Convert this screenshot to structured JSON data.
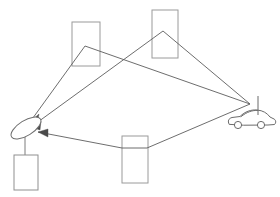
{
  "canvas": {
    "width": 280,
    "height": 197,
    "background": "#ffffff",
    "title": "Multipath radio propagation diagram"
  },
  "palette": {
    "building_stroke": "#9a9a9a",
    "equipment_stroke": "#8f8f8f",
    "ray_stroke": "#5c5c5c",
    "arrow_fill": "#4a4a4a",
    "dish_stroke": "#6e6e6e",
    "vehicle_stroke": "#6b6b6b",
    "background": "#ffffff"
  },
  "scene": {
    "label": "multipath-propagation-scene",
    "description": "A parabolic dish ground station receives one direct path and two reflected paths from a moving vehicle with a whip antenna.",
    "node_count": 6,
    "ray_count": 3
  },
  "buildings": [
    {
      "name": "building-top-left",
      "x": 72,
      "y": 22,
      "width": 28,
      "height": 44,
      "role": "reflector"
    },
    {
      "name": "building-top-right",
      "x": 152,
      "y": 10,
      "width": 26,
      "height": 48,
      "role": "reflector"
    },
    {
      "name": "building-bottom-center",
      "x": 122,
      "y": 136,
      "width": 26,
      "height": 47,
      "role": "reflector"
    }
  ],
  "ground_station": {
    "name": "satellite-dish-ground-station",
    "dish": {
      "cx": 26,
      "cy": 128,
      "rx": 17,
      "ry": 7.5,
      "rotation_deg": -28
    },
    "mast": {
      "x1": 25,
      "y1": 135,
      "x2": 25,
      "y2": 155
    },
    "equipment_box": {
      "x": 14,
      "y": 155,
      "width": 24,
      "height": 35
    }
  },
  "vehicle": {
    "name": "car-with-whip-antenna",
    "body_x": 228,
    "body_y": 112,
    "body_width": 44,
    "body_height": 16,
    "antenna": {
      "x1": 258,
      "y1": 96,
      "x2": 258,
      "y2": 114
    },
    "wheels": [
      {
        "cx": 238,
        "cy": 126,
        "r": 3.6
      },
      {
        "cx": 260,
        "cy": 126,
        "r": 3.6
      }
    ]
  },
  "rays": [
    {
      "name": "ray-reflected-via-top-left-building",
      "points": "250,104 85,46 30,122",
      "arrow_at": "30,122",
      "arrow_angle_deg": 126,
      "path_type": "reflected"
    },
    {
      "name": "ray-reflected-via-top-right-building",
      "points": "250,104 163,31 31,127",
      "arrow_at": "31,127",
      "arrow_angle_deg": 140,
      "path_type": "reflected"
    },
    {
      "name": "ray-reflected-via-bottom-building",
      "points": "250,104 147,148 122,148 38,132",
      "arrow_at": "38,132",
      "arrow_angle_deg": 191,
      "path_type": "reflected"
    }
  ],
  "legend": {
    "dish_label": "Dish antenna",
    "equipment_label": "Receiver unit",
    "vehicle_label": "Mobile transmitter",
    "building_label": "Reflecting structure"
  }
}
